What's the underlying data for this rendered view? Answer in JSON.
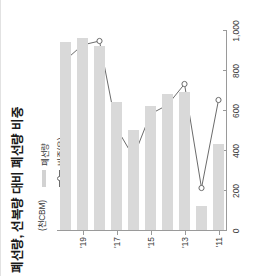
{
  "chart_data": {
    "type": "bar",
    "title": "폐선량, 선복량 대비 폐선량 비중",
    "unit_label": "(천CBM)",
    "xlabel": "",
    "ylabel": "",
    "categories": [
      "'11",
      "'12",
      "'13",
      "'14",
      "'15",
      "'16",
      "'17",
      "'18",
      "'19",
      "'20"
    ],
    "tick_categories": [
      "'11",
      "'13",
      "'15",
      "'17",
      "'19"
    ],
    "value_ticks": [
      "0",
      "200",
      "400",
      "600",
      "800",
      "1,000"
    ],
    "value_tick_numbers": [
      0,
      200,
      400,
      600,
      800,
      1000
    ],
    "xlim": [
      0,
      1000
    ],
    "grid": false,
    "legend_position": "upper-left",
    "series": [
      {
        "name": "폐선량",
        "type": "bar",
        "color": "#d9d9d9",
        "axis": "left",
        "values": [
          430,
          120,
          690,
          680,
          620,
          500,
          640,
          920,
          960,
          940
        ]
      },
      {
        "name": "비중(우)",
        "type": "line",
        "color": "#6b6b6b",
        "marker": "open-circle",
        "axis": "right",
        "values": [
          655,
          215,
          735,
          630,
          585,
          370,
          515,
          950,
          930,
          855
        ]
      }
    ]
  },
  "chart": {
    "title": "폐선량, 선복량 대비 폐선량 비중",
    "unit": "(천CBM)",
    "legend": [
      {
        "label": "폐선량",
        "marker": "bar-swatch"
      },
      {
        "label": "비중(우)",
        "marker": "line-marker"
      }
    ]
  }
}
